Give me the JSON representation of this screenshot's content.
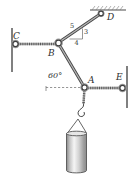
{
  "figure": {
    "type": "statics-rope-diagram",
    "points": {
      "C": "C",
      "B": "B",
      "D": "D",
      "A": "A",
      "E": "E"
    },
    "angle_label": "60°",
    "slope_triangle": {
      "hypotenuse": "5",
      "horizontal": "4",
      "vertical": "3"
    },
    "colors": {
      "line": "#4a4a4a",
      "rope_dark": "#5a5a5a",
      "rope_light": "#b0b0b0",
      "rod_core": "#b5b5b5",
      "label_text": "#2f2f2f",
      "cylinder_edge": "#8a8a8a",
      "cylinder_highlight": "#f5f5f5",
      "background": "#ffffff"
    }
  }
}
